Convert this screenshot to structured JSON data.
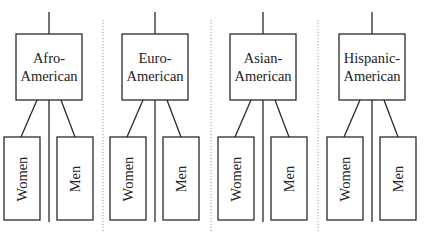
{
  "diagram": {
    "type": "hierarchy",
    "colors": {
      "line": "#2a2a2a",
      "separator": "#9a9a9a",
      "background": "#ffffff"
    },
    "separators_x": [
      103,
      211,
      318
    ],
    "groups": [
      {
        "id": "afro-american",
        "label": "Afro-\nAmerican",
        "center_x": 49,
        "children": [
          {
            "label": "Women"
          },
          {
            "label": "Men"
          }
        ]
      },
      {
        "id": "euro-american",
        "label": "Euro-\nAmerican",
        "center_x": 155,
        "children": [
          {
            "label": "Women"
          },
          {
            "label": "Men"
          }
        ]
      },
      {
        "id": "asian-american",
        "label": "Asian-\nAmerican",
        "center_x": 263,
        "children": [
          {
            "label": "Women"
          },
          {
            "label": "Men"
          }
        ]
      },
      {
        "id": "hispanic-american",
        "label": "Hispanic-\nAmerican",
        "center_x": 372,
        "children": [
          {
            "label": "Women"
          },
          {
            "label": "Men"
          }
        ]
      }
    ]
  }
}
